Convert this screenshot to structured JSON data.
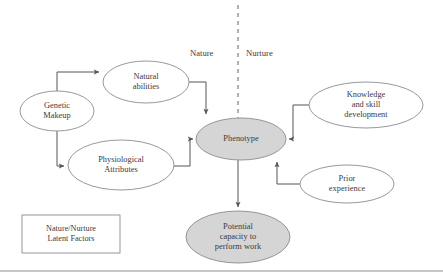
{
  "diagram": {
    "colors": {
      "stroke": "#8b8b93",
      "text": "#3b3b43",
      "shaded_fill": "#d5d5d5",
      "plain_fill": "#ffffff",
      "connector": "#55555c",
      "divider": "#8f8f97",
      "footer_rule": "#8d8d95"
    },
    "divider": {
      "name": "nature-nurture-divider",
      "style": "dashed-vertical",
      "x": 238,
      "y_top": 5,
      "y_bottom": 118
    },
    "side_labels": [
      {
        "id": "nature",
        "text": "Nature",
        "x": 190,
        "y": 48
      },
      {
        "id": "nurture",
        "text": "Nurture",
        "x": 246,
        "y": 48
      }
    ],
    "nodes": [
      {
        "id": "genetic-makeup",
        "text": "Genetic\nMakeup",
        "shape": "ellipse",
        "shaded": false,
        "cx": 57,
        "cy": 111,
        "rx": 37,
        "ry": 20
      },
      {
        "id": "natural-abilities",
        "text": "Natural\nabilities",
        "shape": "ellipse",
        "shaded": false,
        "cx": 146,
        "cy": 82,
        "rx": 43,
        "ry": 21
      },
      {
        "id": "physiological-attributes",
        "text": "Physiological\nAttributes",
        "shape": "ellipse",
        "shaded": false,
        "cx": 121,
        "cy": 165,
        "rx": 53,
        "ry": 25
      },
      {
        "id": "phenotype",
        "text": "Phenotype",
        "shape": "ellipse",
        "shaded": true,
        "cx": 241,
        "cy": 139,
        "rx": 45,
        "ry": 21
      },
      {
        "id": "knowledge-and-skill-development",
        "text": "Knowledge\nand skill\ndevelopment",
        "shape": "ellipse",
        "shaded": false,
        "cx": 366,
        "cy": 105,
        "rx": 57,
        "ry": 23
      },
      {
        "id": "prior-experience",
        "text": "Prior\nexperience",
        "shape": "ellipse",
        "shaded": false,
        "cx": 347,
        "cy": 184,
        "rx": 47,
        "ry": 19
      },
      {
        "id": "potential-capacity-to-perform-work",
        "text": "Potential\ncapacity to\nperform work",
        "shape": "ellipse",
        "shaded": true,
        "cx": 238,
        "cy": 237,
        "rx": 52,
        "ry": 26
      }
    ],
    "legend": {
      "id": "nature-nurture-latent-factors",
      "text": "Nature/Nurture\nLatent Factors",
      "x": 22,
      "y": 215,
      "width": 98,
      "height": 38
    },
    "edges": [
      {
        "id": "genetic-makeup-to-natural-abilities",
        "from": "genetic-makeup",
        "to": "natural-abilities",
        "path": "M 57 91 L 57 72 L 99 72",
        "arrow": true
      },
      {
        "id": "genetic-makeup-to-physiological-attributes",
        "from": "genetic-makeup",
        "to": "physiological-attributes",
        "path": "M 57 131 L 57 166 L 64 166",
        "arrow": true
      },
      {
        "id": "natural-abilities-to-phenotype",
        "from": "natural-abilities",
        "to": "phenotype",
        "path": "M 189 82 L 206 82 L 206 114",
        "arrow": true
      },
      {
        "id": "physiological-attributes-to-phenotype",
        "from": "physiological-attributes",
        "to": "phenotype",
        "path": "M 174 166 L 190 166 L 190 139 L 193 139",
        "arrow": true
      },
      {
        "id": "knowledge-and-skill-development-to-phenotype",
        "from": "knowledge-and-skill-development",
        "to": "phenotype",
        "path": "M 309 105 L 293 105 L 293 139 L 289 139",
        "arrow": true
      },
      {
        "id": "prior-experience-to-phenotype",
        "from": "prior-experience",
        "to": "phenotype",
        "path": "M 300 184 L 277 184 L 277 162",
        "arrow": true
      },
      {
        "id": "phenotype-to-potential-capacity",
        "from": "phenotype",
        "to": "potential-capacity-to-perform-work",
        "path": "M 238 160 L 238 207",
        "arrow": true
      }
    ],
    "footer_rule": {
      "id": "footer-rule",
      "x1": 0,
      "x2": 443,
      "y": 271
    }
  }
}
